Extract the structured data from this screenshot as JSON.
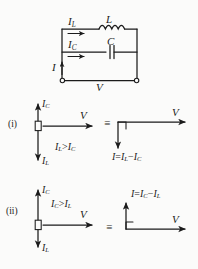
{
  "figure": {
    "background_color": "#fbfbfa",
    "ink_color": "#1b1b1b"
  },
  "circuit": {
    "name": "parallel-lc-circuit",
    "components": [
      {
        "id": "inductor",
        "label": "L",
        "symbol": "coil"
      },
      {
        "id": "capacitor",
        "label": "C",
        "symbol": "parallel-plates"
      }
    ],
    "currents": [
      {
        "id": "total-current",
        "label": "I",
        "direction": "up"
      },
      {
        "id": "inductor-current",
        "base": "I",
        "sub": "L",
        "direction": "right"
      },
      {
        "id": "capacitor-current",
        "base": "I",
        "sub": "C",
        "direction": "right"
      }
    ],
    "source_label": "V",
    "terminals": 2
  },
  "cases": [
    {
      "marker": "(i)",
      "name": "case-inductive",
      "condition": {
        "left": "I",
        "left_sub": "L",
        "relation": ">",
        "right": "I",
        "right_sub": "C"
      },
      "condition_text": "IL > IC",
      "phasors": [
        {
          "id": "ic-up",
          "base": "I",
          "sub": "C",
          "direction": "up"
        },
        {
          "id": "il-down",
          "base": "I",
          "sub": "L",
          "direction": "down"
        },
        {
          "id": "v-right",
          "base": "V",
          "sub": "",
          "direction": "right"
        }
      ],
      "equivalence_symbol": "≡",
      "resultant": {
        "id": "resultant-current",
        "expression_lhs": "I",
        "equals": "=",
        "term1": "I",
        "term1_sub": "L",
        "minus": "−",
        "term2": "I",
        "term2_sub": "C",
        "direction": "down"
      },
      "result_v_label": "V",
      "right_angle_marker": true
    },
    {
      "marker": "(ii)",
      "name": "case-capacitive",
      "condition": {
        "left": "I",
        "left_sub": "C",
        "relation": ">",
        "right": "I",
        "right_sub": "L"
      },
      "condition_text": "IC > IL",
      "phasors": [
        {
          "id": "ic-up",
          "base": "I",
          "sub": "C",
          "direction": "up"
        },
        {
          "id": "il-down",
          "base": "I",
          "sub": "L",
          "direction": "down"
        },
        {
          "id": "v-right",
          "base": "V",
          "sub": "",
          "direction": "right"
        }
      ],
      "equivalence_symbol": "≡",
      "resultant": {
        "id": "resultant-current",
        "expression_lhs": "I",
        "equals": "=",
        "term1": "I",
        "term1_sub": "C",
        "minus": "−",
        "term2": "I",
        "term2_sub": "L",
        "direction": "up"
      },
      "result_v_label": "V",
      "right_angle_marker": true
    }
  ]
}
